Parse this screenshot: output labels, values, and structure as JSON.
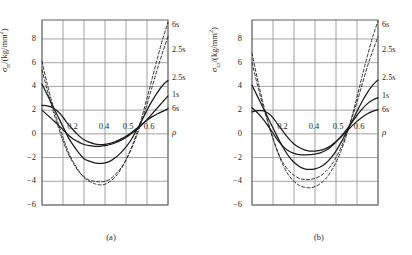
{
  "figure": {
    "panels": [
      {
        "id": "a",
        "caption": "(a)",
        "ylabel_main": "σ",
        "ylabel_sub": "rr",
        "ylabel_unit": "/(kg/mm",
        "ylabel_sup": "2",
        "ylabel_close": ")",
        "xaxis_symbol": "ρ"
      },
      {
        "id": "b",
        "caption": "(b)",
        "ylabel_main": "σ",
        "ylabel_sub": "zz",
        "ylabel_unit": "/(kg/mm",
        "ylabel_sup": "2",
        "ylabel_close": ")",
        "xaxis_symbol": "ρ"
      }
    ]
  },
  "chart_data": [
    {
      "type": "line",
      "panel": "a",
      "title": "",
      "xlabel": "ρ",
      "ylabel": "σrr/(kg/mm2)",
      "xlim": [
        0.1,
        0.7
      ],
      "ylim": [
        -6,
        9.6
      ],
      "yticks": [
        8,
        6,
        4,
        2,
        0,
        -2,
        -4,
        -6
      ],
      "ytick_labels": [
        "8",
        "6",
        "4",
        "2",
        "0",
        "-2",
        "-4",
        "-6"
      ],
      "xticks": [
        0.1,
        0.2,
        0.3,
        0.4,
        0.5,
        0.6,
        0.7
      ],
      "x_inplot_labels": [
        {
          "text": "0.2",
          "x": 0.22
        },
        {
          "text": "0.4",
          "x": 0.37
        },
        {
          "text": "0.5",
          "x": 0.485
        },
        {
          "text": "0.6",
          "x": 0.585
        }
      ],
      "grid": true,
      "legend_position": "right-edge-labels",
      "x": [
        0.1,
        0.125,
        0.15,
        0.175,
        0.2,
        0.225,
        0.25,
        0.275,
        0.3,
        0.325,
        0.35,
        0.375,
        0.4,
        0.425,
        0.45,
        0.475,
        0.5,
        0.525,
        0.55,
        0.575,
        0.6,
        0.625,
        0.65,
        0.675,
        0.7
      ],
      "series": [
        {
          "name": "6s-dashed",
          "style": "dashed",
          "label": "6s",
          "label_y": 9.1,
          "values": [
            6.1,
            4.2,
            2.5,
            1.0,
            -0.3,
            -1.5,
            -2.4,
            -3.1,
            -3.7,
            -4.0,
            -4.2,
            -4.3,
            -4.25,
            -4.0,
            -3.6,
            -3.0,
            -2.2,
            -1.2,
            0.0,
            1.4,
            3.0,
            4.7,
            6.4,
            8.0,
            9.4
          ]
        },
        {
          "name": "2.5s-dashed",
          "style": "dashed",
          "label": "2.5s",
          "label_y": 7.0,
          "values": [
            5.4,
            3.7,
            2.1,
            0.7,
            -0.6,
            -1.7,
            -2.5,
            -3.2,
            -3.6,
            -3.9,
            -4.0,
            -4.05,
            -4.0,
            -3.8,
            -3.4,
            -2.9,
            -2.2,
            -1.3,
            -0.2,
            1.1,
            2.5,
            4.0,
            5.5,
            6.9,
            8.2
          ]
        },
        {
          "name": "2.5s-solid",
          "style": "solid",
          "label": "2.5s",
          "label_y": 4.6,
          "values": [
            4.2,
            3.3,
            2.4,
            1.5,
            0.6,
            -0.3,
            -1.0,
            -1.6,
            -2.1,
            -2.3,
            -2.45,
            -2.5,
            -2.45,
            -2.3,
            -2.0,
            -1.6,
            -1.1,
            -0.5,
            0.3,
            1.1,
            2.0,
            2.8,
            3.5,
            4.1,
            4.5
          ]
        },
        {
          "name": "1s-solid",
          "style": "solid",
          "label": "1s",
          "label_y": 3.2,
          "values": [
            2.0,
            1.6,
            1.2,
            0.8,
            0.35,
            -0.1,
            -0.45,
            -0.7,
            -0.9,
            -1.0,
            -1.05,
            -1.05,
            -1.0,
            -0.9,
            -0.75,
            -0.55,
            -0.3,
            0.0,
            0.35,
            0.75,
            1.2,
            1.7,
            2.2,
            2.7,
            3.2
          ]
        },
        {
          "name": "6s-solid",
          "style": "solid",
          "label": "6s",
          "label_y": 2.0,
          "values": [
            2.4,
            2.35,
            2.2,
            1.9,
            1.4,
            0.8,
            0.3,
            -0.15,
            -0.5,
            -0.7,
            -0.85,
            -0.9,
            -0.88,
            -0.8,
            -0.65,
            -0.45,
            -0.2,
            0.1,
            0.45,
            0.8,
            1.15,
            1.45,
            1.7,
            1.9,
            2.1
          ]
        }
      ]
    },
    {
      "type": "line",
      "panel": "b",
      "title": "",
      "xlabel": "ρ",
      "ylabel": "σzz/(kg/mm2)",
      "xlim": [
        0.1,
        0.7
      ],
      "ylim": [
        -6,
        9.6
      ],
      "yticks": [
        8,
        6,
        4,
        2,
        0,
        -2,
        -4,
        -6
      ],
      "ytick_labels": [
        "8",
        "6",
        "4",
        "2",
        "0",
        "-2",
        "-4",
        "-6"
      ],
      "xticks": [
        0.1,
        0.2,
        0.3,
        0.4,
        0.5,
        0.6,
        0.7
      ],
      "x_inplot_labels": [
        {
          "text": "0.2",
          "x": 0.22
        },
        {
          "text": "0.4",
          "x": 0.37
        },
        {
          "text": "0.5",
          "x": 0.485
        },
        {
          "text": "0.6",
          "x": 0.585
        }
      ],
      "grid": true,
      "legend_position": "right-edge-labels",
      "x": [
        0.1,
        0.125,
        0.15,
        0.175,
        0.2,
        0.225,
        0.25,
        0.275,
        0.3,
        0.325,
        0.35,
        0.375,
        0.4,
        0.425,
        0.45,
        0.475,
        0.5,
        0.525,
        0.55,
        0.575,
        0.6,
        0.625,
        0.65,
        0.675,
        0.7
      ],
      "series": [
        {
          "name": "6s-dashed",
          "style": "dashed",
          "label": "6s",
          "label_y": 9.1,
          "values": [
            6.8,
            4.7,
            2.8,
            1.1,
            -0.4,
            -1.7,
            -2.7,
            -3.5,
            -4.0,
            -4.35,
            -4.5,
            -4.55,
            -4.45,
            -4.2,
            -3.8,
            -3.2,
            -2.4,
            -1.4,
            -0.1,
            1.4,
            3.1,
            4.9,
            6.6,
            8.2,
            9.5
          ]
        },
        {
          "name": "2.5s-dashed",
          "style": "dashed",
          "label": "2.5s",
          "label_y": 7.0,
          "values": [
            6.0,
            4.2,
            2.5,
            1.0,
            -0.4,
            -1.6,
            -2.5,
            -3.1,
            -3.5,
            -3.75,
            -3.85,
            -3.85,
            -3.75,
            -3.55,
            -3.2,
            -2.7,
            -2.0,
            -1.1,
            0.0,
            1.3,
            2.7,
            4.2,
            5.7,
            7.0,
            8.2
          ]
        },
        {
          "name": "2.5s-solid",
          "style": "solid",
          "label": "2.5s",
          "label_y": 4.6,
          "values": [
            4.1,
            3.2,
            2.3,
            1.4,
            0.5,
            -0.4,
            -1.2,
            -1.9,
            -2.4,
            -2.75,
            -2.95,
            -3.0,
            -2.95,
            -2.8,
            -2.5,
            -2.05,
            -1.45,
            -0.7,
            0.15,
            1.0,
            1.9,
            2.75,
            3.5,
            4.1,
            4.55
          ]
        },
        {
          "name": "1s-solid",
          "style": "solid",
          "label": "1s",
          "label_y": 3.1,
          "values": [
            2.2,
            1.8,
            1.3,
            0.7,
            0.05,
            -0.6,
            -1.1,
            -1.45,
            -1.65,
            -1.75,
            -1.78,
            -1.75,
            -1.7,
            -1.6,
            -1.4,
            -1.1,
            -0.7,
            -0.2,
            0.35,
            0.95,
            1.55,
            2.1,
            2.55,
            2.85,
            3.05
          ]
        },
        {
          "name": "6s-solid",
          "style": "solid",
          "label": "6s",
          "label_y": 1.95,
          "values": [
            1.85,
            1.95,
            1.95,
            1.75,
            1.35,
            0.75,
            0.15,
            -0.4,
            -0.85,
            -1.15,
            -1.35,
            -1.45,
            -1.45,
            -1.4,
            -1.25,
            -1.0,
            -0.65,
            -0.25,
            0.2,
            0.65,
            1.05,
            1.4,
            1.7,
            1.9,
            2.05
          ]
        }
      ]
    }
  ]
}
